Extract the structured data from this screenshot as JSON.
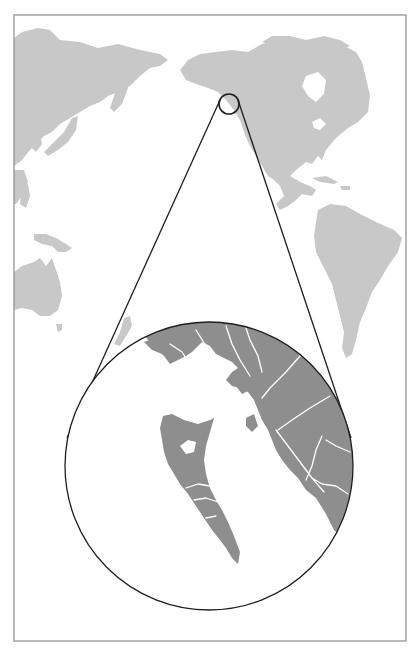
{
  "map": {
    "type": "locator-map",
    "projection": "pacific-centered world",
    "frame": {
      "x": 14,
      "y": 15,
      "width": 392,
      "height": 626,
      "stroke": "#8a8a8a"
    },
    "colors": {
      "background": "#ffffff",
      "world_land": "#c8c8c8",
      "inset_land": "#8e8e8e",
      "waterways": "#ffffff",
      "leader_lines": "#1e1e1e"
    },
    "locator_circle": {
      "cx": 229,
      "cy": 104,
      "r": 10,
      "region": "Haida Gwaii / Southeast Alaska coast"
    },
    "inset_circle": {
      "cx": 209,
      "cy": 466,
      "r": 144,
      "region": "Haida Gwaii and British Columbia north coast (zoomed)"
    },
    "continents_visible": [
      "Asia",
      "North America",
      "South America",
      "Australia",
      "New Zealand",
      "Papua New Guinea",
      "Japan"
    ]
  }
}
